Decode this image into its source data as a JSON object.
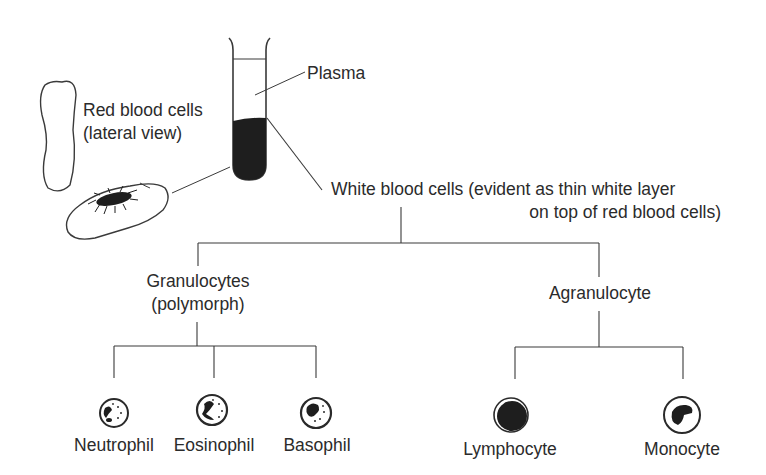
{
  "diagram": {
    "labels": {
      "plasma": "Plasma",
      "rbc_line1": "Red blood cells",
      "rbc_line2": "(lateral view)",
      "wbc_line1": "White blood cells (evident as thin white layer",
      "wbc_line2": "on top of red blood cells)",
      "granulocytes_line1": "Granulocytes",
      "granulocytes_line2": "(polymorph)",
      "agranulocyte": "Agranulocyte"
    },
    "granulocytes": [
      {
        "name": "Neutrophil",
        "icon": "neutrophil-cell-icon"
      },
      {
        "name": "Eosinophil",
        "icon": "eosinophil-cell-icon"
      },
      {
        "name": "Basophil",
        "icon": "basophil-cell-icon"
      }
    ],
    "agranulocytes": [
      {
        "name": "Lymphocyte",
        "icon": "lymphocyte-cell-icon"
      },
      {
        "name": "Monocyte",
        "icon": "monocyte-cell-icon"
      }
    ],
    "colors": {
      "line": "#3a3a3a",
      "fill_dark": "#1e1e1e",
      "background": "#ffffff"
    }
  }
}
